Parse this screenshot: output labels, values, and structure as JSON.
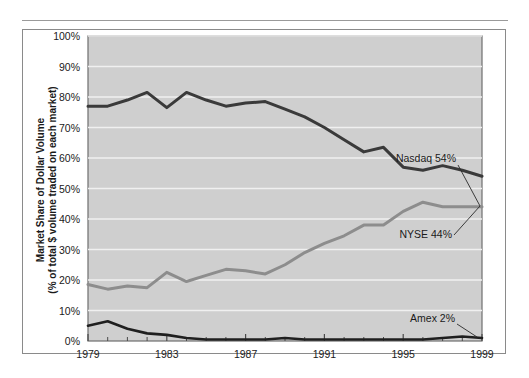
{
  "figure": {
    "has_top_rule": true,
    "frame_border_color": "#8a8a8a",
    "plot_background_color": "#cfcfcf",
    "gridline_color": "#f0f0f0"
  },
  "chart_data": {
    "type": "line",
    "title": "",
    "xlabel": "",
    "ylabel": "Market Share of Dollar Volume",
    "ylabel_line2": "(% of total $ volume traded on each market)",
    "grid": true,
    "legend_position": "inline-annotations",
    "xlim": [
      1979,
      1999
    ],
    "ylim": [
      0,
      100
    ],
    "ytick_labels": [
      "0%",
      "10%",
      "20%",
      "30%",
      "40%",
      "50%",
      "60%",
      "70%",
      "80%",
      "90%",
      "100%"
    ],
    "ytick_values": [
      0,
      10,
      20,
      30,
      40,
      50,
      60,
      70,
      80,
      90,
      100
    ],
    "xtick_labels": [
      "1979",
      "1983",
      "1987",
      "1991",
      "1995",
      "1999"
    ],
    "xtick_values": [
      1979,
      1983,
      1987,
      1991,
      1995,
      1999
    ],
    "x": [
      1979,
      1980,
      1981,
      1982,
      1983,
      1984,
      1985,
      1986,
      1987,
      1988,
      1989,
      1990,
      1991,
      1992,
      1993,
      1994,
      1995,
      1996,
      1997,
      1998,
      1999
    ],
    "series": [
      {
        "name": "Nasdaq",
        "color": "#3a3a3a",
        "width": 3.0,
        "end_label": "Nasdaq 54%",
        "end_value": 54,
        "values": [
          77,
          77,
          79,
          81.5,
          76.5,
          81.5,
          79,
          77,
          78,
          78.5,
          76,
          73.5,
          70,
          66,
          62,
          63.5,
          57,
          56,
          57.5,
          56,
          54
        ]
      },
      {
        "name": "NYSE",
        "color": "#8d8d8d",
        "width": 3.0,
        "end_label": "NYSE 44%",
        "end_value": 44,
        "values": [
          18.5,
          17,
          18,
          17.5,
          22.5,
          19.5,
          21.5,
          23.5,
          23,
          22,
          25,
          29,
          32,
          34.5,
          38,
          38,
          42.5,
          45.5,
          44,
          44,
          44
        ]
      },
      {
        "name": "Amex",
        "color": "#1f1f1f",
        "width": 2.6,
        "end_label": "Amex 2%",
        "end_value": 2,
        "values": [
          5,
          6.5,
          4,
          2.5,
          2,
          1,
          0.5,
          0.5,
          0.5,
          0.5,
          1,
          0.5,
          0.5,
          0.5,
          0.5,
          0.5,
          0.5,
          0.5,
          1,
          1.5,
          1
        ]
      }
    ],
    "annotations": [
      {
        "label": "Nasdaq 54%",
        "anchor_series": "Nasdaq"
      },
      {
        "label": "NYSE 44%",
        "anchor_series": "NYSE"
      },
      {
        "label": "Amex 2%",
        "anchor_series": "Amex"
      }
    ]
  }
}
